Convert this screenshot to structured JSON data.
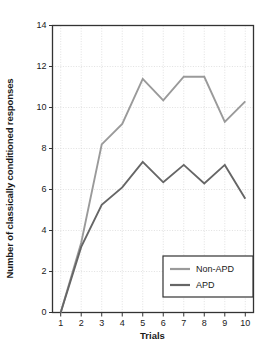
{
  "chart_data": {
    "type": "line",
    "title": "",
    "xlabel": "Trials",
    "ylabel": "Number of classically conditioned responses",
    "x": [
      1,
      2,
      3,
      4,
      5,
      6,
      7,
      8,
      9,
      10
    ],
    "xtick_labels": [
      "1",
      "2",
      "3",
      "4",
      "5",
      "6",
      "7",
      "8",
      "9",
      "10"
    ],
    "ytick_labels": [
      "0",
      "2",
      "4",
      "6",
      "8",
      "10",
      "12",
      "14"
    ],
    "yticks": [
      0,
      2,
      4,
      6,
      8,
      10,
      12,
      14
    ],
    "xlim": [
      0.6,
      10.4
    ],
    "ylim": [
      0,
      14
    ],
    "grid": true,
    "legend_position": "lower right",
    "series": [
      {
        "name": "Non-APD",
        "color": "#9a9a9a",
        "values": [
          0,
          3.4,
          8.2,
          9.2,
          11.4,
          10.35,
          11.5,
          11.5,
          9.3,
          10.3
        ]
      },
      {
        "name": "APD",
        "color": "#666666",
        "values": [
          0,
          3.2,
          5.25,
          6.1,
          7.35,
          6.35,
          7.2,
          6.3,
          7.2,
          5.55
        ]
      }
    ]
  },
  "axes": {
    "frame_color": "#333333",
    "grid_color": "#cccccc",
    "tick_color": "#333333"
  },
  "legend": {
    "border_color": "#333333",
    "entries": [
      {
        "label": "Non-APD",
        "color": "#9a9a9a"
      },
      {
        "label": "APD",
        "color": "#666666"
      }
    ]
  }
}
